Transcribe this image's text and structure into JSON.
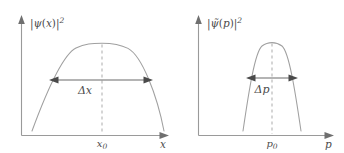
{
  "figure": {
    "background_color": "#ffffff",
    "curve_color": "#a0a0a0",
    "axis_color": "#9a9a9a",
    "label_color": "#4c4c4c",
    "arrow_color": "#4a4a4a",
    "dash_color": "#b0b0b0"
  },
  "panels": [
    {
      "id": "position-panel",
      "y_axis_label": "|ψ(x)|²",
      "y_axis_label_parts": {
        "bar_open": "|",
        "symbol": "ψ",
        "arg_open": "(",
        "arg": "x",
        "arg_close": ")",
        "bar_close": "|",
        "exponent": "2"
      },
      "x_axis_label": "x",
      "center_tick_label": "x₀",
      "center_tick_label_parts": {
        "symbol": "x",
        "subscript": "0"
      },
      "spread_label": "Δx",
      "spread_label_parts": {
        "delta": "Δ",
        "symbol": "x"
      },
      "has_dashed_center_line": true,
      "has_double_arrow": true
    },
    {
      "id": "momentum-panel",
      "y_axis_label": "|ψ̃(p)|²",
      "y_axis_label_parts": {
        "bar_open": "|",
        "symbol": "ψ",
        "accent": "̃",
        "arg_open": "(",
        "arg": "p",
        "arg_close": ")",
        "bar_close": "|",
        "exponent": "2"
      },
      "x_axis_label": "p",
      "center_tick_label": "p₀",
      "center_tick_label_parts": {
        "symbol": "p",
        "subscript": "0"
      },
      "spread_label": "Δp",
      "spread_label_parts": {
        "delta": "Δ",
        "symbol": "p"
      },
      "has_dashed_center_line": true,
      "has_double_arrow": true
    }
  ],
  "chart_data": {
    "type": "line",
    "title": "",
    "xlabel": "",
    "ylabel": "",
    "grid": false,
    "legend": null,
    "subplots": [
      {
        "name": "position-panel",
        "xlabel": "x",
        "ylabel": "|ψ(x)|²",
        "center": "x₀",
        "width_annotation": "Δx",
        "shape": "broad inverted parabola (wide peak)",
        "peak_px": {
          "x": 102,
          "y": 44
        },
        "baseline_y_px": 135,
        "curve_endpoints_px": [
          {
            "x": 32,
            "y": 131
          },
          {
            "x": 164,
            "y": 131
          }
        ],
        "arrow_span_px": {
          "x1": 50,
          "x2": 152,
          "y": 80
        },
        "relative_width": 1.0
      },
      {
        "name": "momentum-panel",
        "xlabel": "p",
        "ylabel": "|ψ̃(p)|²",
        "center": "p₀",
        "width_annotation": "Δp",
        "shape": "narrow inverted parabola (narrow peak)",
        "peak_px": {
          "x": 272,
          "y": 43
        },
        "baseline_y_px": 135,
        "curve_endpoints_px": [
          {
            "x": 243,
            "y": 131
          },
          {
            "x": 301,
            "y": 131
          }
        ],
        "arrow_span_px": {
          "x1": 247,
          "x2": 297,
          "y": 78
        },
        "relative_width": 0.49
      }
    ],
    "note": "Wide position spread Δx paired with narrow momentum spread Δp"
  }
}
